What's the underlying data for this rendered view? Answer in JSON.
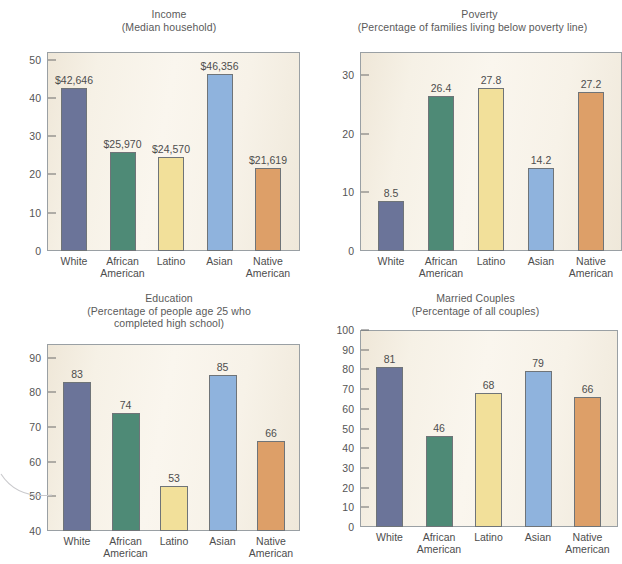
{
  "figure": {
    "palette": {
      "white": "#6b7499",
      "african_american": "#4e8a76",
      "latino": "#f2e09a",
      "asian": "#8fb3dd",
      "native_american": "#dd9f68",
      "plot_background": "#f7f2e8",
      "frame": "#9aa0a4",
      "text": "#4d4d4d"
    },
    "categories": [
      "White",
      "African\nAmerican",
      "Latino",
      "Asian",
      "Native\nAmerican"
    ]
  },
  "chart_data": [
    {
      "id": "income",
      "type": "bar",
      "title": "Income",
      "subtitle": "(Median household)",
      "xlabel": "",
      "ylabel": "",
      "ylim": [
        0,
        52
      ],
      "yticks": [
        0,
        10,
        20,
        30,
        40,
        50
      ],
      "ytick_labels": [
        "0",
        "10",
        "20",
        "30",
        "40",
        "50"
      ],
      "grid": false,
      "legend": "none",
      "categories": [
        "White",
        "African\nAmerican",
        "Latino",
        "Asian",
        "Native\nAmerican"
      ],
      "values": [
        42.646,
        25.97,
        24.57,
        46.356,
        21.619
      ],
      "data_labels": [
        "$42,646",
        "$25,970",
        "$24,570",
        "$46,356",
        "$21,619"
      ],
      "colors": [
        "#6b7499",
        "#4e8a76",
        "#f2e09a",
        "#8fb3dd",
        "#dd9f68"
      ]
    },
    {
      "id": "poverty",
      "type": "bar",
      "title": "Poverty",
      "subtitle": "(Percentage of families living below poverty line)",
      "xlabel": "",
      "ylabel": "",
      "ylim": [
        0,
        34
      ],
      "yticks": [
        0,
        10,
        20,
        30
      ],
      "ytick_labels": [
        "0",
        "10",
        "20",
        "30"
      ],
      "grid": false,
      "legend": "none",
      "categories": [
        "White",
        "African\nAmerican",
        "Latino",
        "Asian",
        "Native\nAmerican"
      ],
      "values": [
        8.5,
        26.4,
        27.8,
        14.2,
        27.2
      ],
      "data_labels": [
        "8.5",
        "26.4",
        "27.8",
        "14.2",
        "27.2"
      ],
      "colors": [
        "#6b7499",
        "#4e8a76",
        "#f2e09a",
        "#8fb3dd",
        "#dd9f68"
      ]
    },
    {
      "id": "education",
      "type": "bar",
      "title": "Education",
      "subtitle": "(Percentage of people age 25 who\ncompleted high school)",
      "xlabel": "",
      "ylabel": "",
      "ylim": [
        40,
        94
      ],
      "yticks": [
        40,
        50,
        60,
        70,
        80,
        90
      ],
      "ytick_labels": [
        "40",
        "50",
        "60",
        "70",
        "80",
        "90"
      ],
      "grid": false,
      "legend": "none",
      "categories": [
        "White",
        "African\nAmerican",
        "Latino",
        "Asian",
        "Native\nAmerican"
      ],
      "values": [
        83,
        74,
        53,
        85,
        66
      ],
      "data_labels": [
        "83",
        "74",
        "53",
        "85",
        "66"
      ],
      "colors": [
        "#6b7499",
        "#4e8a76",
        "#f2e09a",
        "#8fb3dd",
        "#dd9f68"
      ]
    },
    {
      "id": "married-couples",
      "type": "bar",
      "title": "Married Couples",
      "subtitle": "(Percentage of all couples)",
      "xlabel": "",
      "ylabel": "",
      "ylim": [
        0,
        100
      ],
      "yticks": [
        0,
        10,
        20,
        30,
        40,
        50,
        60,
        70,
        80,
        90,
        100
      ],
      "ytick_labels": [
        "0",
        "10",
        "20",
        "30",
        "40",
        "50",
        "60",
        "70",
        "80",
        "90",
        "100"
      ],
      "grid": false,
      "legend": "none",
      "categories": [
        "White",
        "African\nAmerican",
        "Latino",
        "Asian",
        "Native\nAmerican"
      ],
      "values": [
        81,
        46,
        68,
        79,
        66
      ],
      "data_labels": [
        "81",
        "46",
        "68",
        "79",
        "66"
      ],
      "colors": [
        "#6b7499",
        "#4e8a76",
        "#f2e09a",
        "#8fb3dd",
        "#dd9f68"
      ]
    }
  ]
}
